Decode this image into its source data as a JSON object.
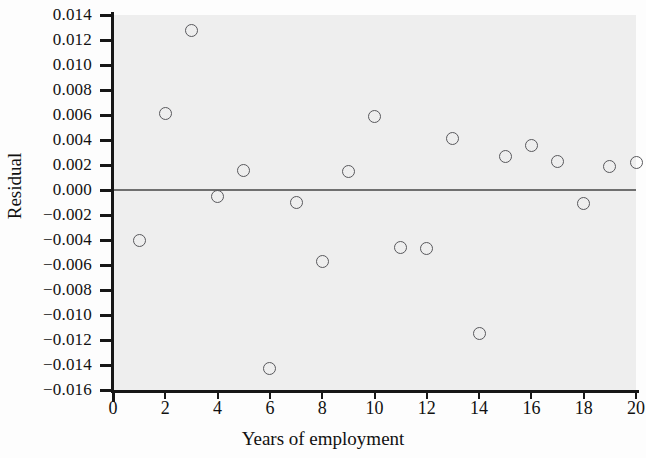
{
  "chart_data": {
    "type": "scatter",
    "title": "",
    "xlabel": "Years of employment",
    "ylabel": "Residual",
    "xlim": [
      0,
      20
    ],
    "ylim": [
      -0.016,
      0.014
    ],
    "xticks": [
      0,
      2,
      4,
      6,
      8,
      10,
      12,
      14,
      16,
      18,
      20
    ],
    "xtick_labels": [
      "0",
      "2",
      "4",
      "6",
      "8",
      "10",
      "12",
      "14",
      "16",
      "18",
      "20"
    ],
    "yticks": [
      0.014,
      0.012,
      0.01,
      0.008,
      0.006,
      0.004,
      0.002,
      0.0,
      -0.002,
      -0.004,
      -0.006,
      -0.008,
      -0.01,
      -0.012,
      -0.014,
      -0.016
    ],
    "ytick_labels": [
      "0.014",
      "0.012",
      "0.010",
      "0.008",
      "0.006",
      "0.004",
      "0.002",
      "0.000",
      "−0.002",
      "−0.004",
      "−0.006",
      "−0.008",
      "−0.010",
      "−0.012",
      "−0.014",
      "−0.016"
    ],
    "grid": false,
    "legend": false,
    "reference_line": {
      "orientation": "horizontal",
      "y": 0.0,
      "color": "#6f6f6f"
    },
    "marker": {
      "shape": "circle",
      "filled": false,
      "edge_color": "#58585c",
      "size": 13
    },
    "x": [
      1,
      2,
      3,
      4,
      5,
      6,
      7,
      8,
      9,
      10,
      11,
      12,
      13,
      14,
      15,
      16,
      17,
      18,
      19,
      20
    ],
    "y": [
      -0.004,
      0.0061,
      0.0128,
      -0.0005,
      0.0016,
      -0.0143,
      -0.001,
      -0.0057,
      0.0015,
      0.0059,
      -0.0046,
      -0.0047,
      0.0041,
      -0.0115,
      0.0027,
      0.0036,
      0.0023,
      -0.0011,
      0.0019,
      0.0022
    ],
    "points": [
      {
        "x": 1,
        "y": -0.004
      },
      {
        "x": 2,
        "y": 0.0061
      },
      {
        "x": 3,
        "y": 0.0128
      },
      {
        "x": 4,
        "y": -0.0005
      },
      {
        "x": 5,
        "y": 0.0016
      },
      {
        "x": 6,
        "y": -0.0143
      },
      {
        "x": 7,
        "y": -0.001
      },
      {
        "x": 8,
        "y": -0.0057
      },
      {
        "x": 9,
        "y": 0.0015
      },
      {
        "x": 10,
        "y": 0.0059
      },
      {
        "x": 11,
        "y": -0.0046
      },
      {
        "x": 12,
        "y": -0.0047
      },
      {
        "x": 13,
        "y": 0.0041
      },
      {
        "x": 14,
        "y": -0.0115
      },
      {
        "x": 15,
        "y": 0.0027
      },
      {
        "x": 16,
        "y": 0.0036
      },
      {
        "x": 17,
        "y": 0.0023
      },
      {
        "x": 18,
        "y": -0.0011
      },
      {
        "x": 19,
        "y": 0.0019
      },
      {
        "x": 20,
        "y": 0.0022
      }
    ],
    "colors": {
      "background": "#eeeeee",
      "page_background": "#fdfdfd",
      "axis": "#161616",
      "marker_edge": "#58585c",
      "reference_line": "#6f6f6f",
      "text": "#111111"
    }
  }
}
